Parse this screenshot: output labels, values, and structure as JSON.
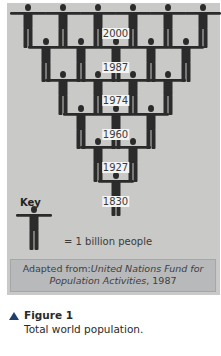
{
  "chart_data": {
    "type": "pictograph",
    "title": "Total world population",
    "unit": "1 figure = 1 billion people",
    "categories": [
      "1830",
      "1927",
      "1960",
      "1974",
      "1987",
      "2000"
    ],
    "values": [
      1,
      2,
      3,
      4,
      5,
      6
    ],
    "xlabel": "",
    "ylabel": "World population (billions)",
    "legend": [
      {
        "symbol": "person-icon",
        "label": "= 1 billion people"
      }
    ],
    "layout": "inverted pyramid of person figures; top row 2000 (6 figures), bottom 1830 (1 figure)"
  },
  "rows": [
    {
      "year": "2000",
      "count": 6
    },
    {
      "year": "1987",
      "count": 5
    },
    {
      "year": "1974",
      "count": 4
    },
    {
      "year": "1960",
      "count": 3
    },
    {
      "year": "1927",
      "count": 2
    },
    {
      "year": "1830",
      "count": 1
    }
  ],
  "key": {
    "title": "Key",
    "text": "=  1 billion people"
  },
  "source": {
    "prefix": "Adapted from:",
    "org_line1": "United Nations Fund for",
    "org_line2": "Population Activities",
    "year": ", 1987"
  },
  "caption": {
    "title": "Figure 1",
    "text": "Total world population."
  },
  "colors": {
    "panel": "#c9c9c7",
    "figure": "#2b2b2b",
    "source_box": "#b7b9bb",
    "caption_triangle": "#1e3f6e"
  }
}
